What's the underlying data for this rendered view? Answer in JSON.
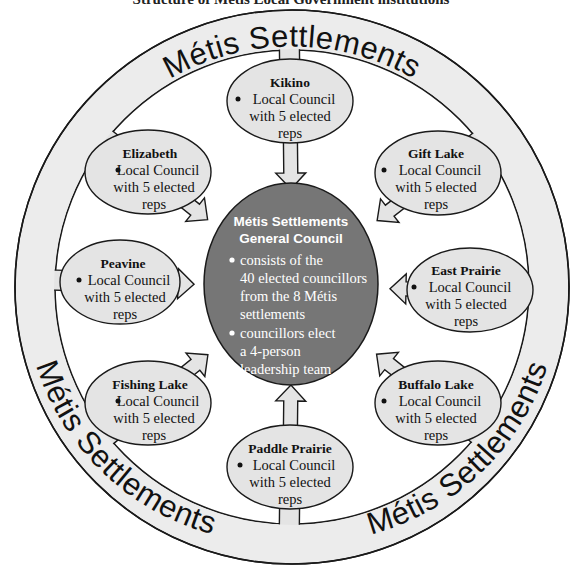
{
  "title": "Structure of Métis Local Government institutions",
  "ring": {
    "label_top": "Métis Settlements",
    "label_left": "Métis Settlements",
    "label_right": "Métis Settlements"
  },
  "center": {
    "title_line1": "Métis Settlements",
    "title_line2": "General Council",
    "bullets": [
      {
        "lines": [
          "consists of the",
          "40 elected councillors",
          "from the 8 Métis",
          "settlements"
        ]
      },
      {
        "lines": [
          "councillors elect",
          "a 4-person",
          "leadership team"
        ]
      }
    ]
  },
  "nodes": [
    {
      "name": "Kikino",
      "line1": "Local Council",
      "line2": "with 5 elected",
      "line3": "reps"
    },
    {
      "name": "Gift Lake",
      "line1": "Local Council",
      "line2": "with 5 elected",
      "line3": "reps"
    },
    {
      "name": "East Prairie",
      "line1": "Local Council",
      "line2": "with 5 elected",
      "line3": "reps"
    },
    {
      "name": "Buffalo Lake",
      "line1": "Local Council",
      "line2": "with 5 elected",
      "line3": "reps"
    },
    {
      "name": "Paddle Prairie",
      "line1": "Local Council",
      "line2": "with 5 elected",
      "line3": "reps"
    },
    {
      "name": "Fishing Lake",
      "line1": "Local Council",
      "line2": "with 5 elected",
      "line3": "reps"
    },
    {
      "name": "Peavine",
      "line1": "Local Council",
      "line2": "with 5 elected",
      "line3": "reps"
    },
    {
      "name": "Elizabeth",
      "line1": "Local Council",
      "line2": "with 5 elected",
      "line3": "reps"
    }
  ],
  "colors": {
    "ring_fill": "#ececec",
    "node_fill": "#e4e4e4",
    "center_fill": "#767676",
    "stroke": "#1a1a1a"
  }
}
